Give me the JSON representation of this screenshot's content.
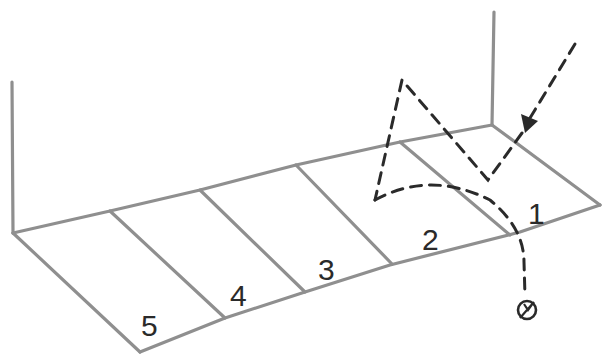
{
  "diagram": {
    "zones": [
      {
        "label": "1",
        "x": 538,
        "y": 215
      },
      {
        "label": "2",
        "x": 432,
        "y": 242
      },
      {
        "label": "3",
        "x": 328,
        "y": 272
      },
      {
        "label": "4",
        "x": 240,
        "y": 298
      },
      {
        "label": "5",
        "x": 150,
        "y": 326
      }
    ],
    "end_marker": {
      "symbol": "Ø",
      "x": 527,
      "y": 310
    },
    "colors": {
      "outline": "#8f8f8f",
      "trajectory": "#2a2a2a",
      "background": "#ffffff"
    }
  }
}
